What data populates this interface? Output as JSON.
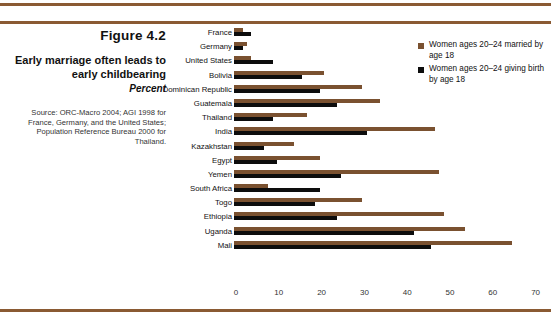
{
  "figure": {
    "number": "Figure 4.2",
    "title": "Early marriage often leads to early childbearing",
    "subtitle": "Percent",
    "source": "Source: ORC-Macro 2004; AGI 1998 for France, Germany, and the United States; Population Reference Bureau 2000 for Thailand."
  },
  "colors": {
    "married_series": "#7a5130",
    "birth_series": "#0d0d0d",
    "rule": "#8a5a33"
  },
  "legend": {
    "items": [
      {
        "label": "Women ages 20–24 married by age 18",
        "color": "#7a5130"
      },
      {
        "label": "Women ages 20–24 giving birth by age 18",
        "color": "#0d0d0d"
      }
    ]
  },
  "axis": {
    "ticks": [
      "0",
      "10",
      "20",
      "30",
      "40",
      "50",
      "60",
      "70"
    ]
  },
  "chart_data": {
    "type": "bar",
    "orientation": "horizontal",
    "title": "Early marriage often leads to early childbearing",
    "xlabel": "Percent",
    "ylabel": "",
    "xlim": [
      0,
      70
    ],
    "grid": false,
    "legend_position": "top-right",
    "categories": [
      "France",
      "Germany",
      "United States",
      "Bolivia",
      "Dominican Republic",
      "Guatemala",
      "Thailand",
      "India",
      "Kazakhstan",
      "Egypt",
      "Yemen",
      "South Africa",
      "Togo",
      "Ethiopia",
      "Uganda",
      "Mali"
    ],
    "series": [
      {
        "name": "Women ages 20–24 married by age 18",
        "color": "#7a5130",
        "values": [
          2,
          3,
          4,
          21,
          30,
          34,
          17,
          47,
          14,
          20,
          48,
          8,
          30,
          49,
          54,
          65
        ]
      },
      {
        "name": "Women ages 20–24 giving birth by age 18",
        "color": "#0d0d0d",
        "values": [
          4,
          2,
          9,
          16,
          20,
          24,
          9,
          31,
          7,
          10,
          25,
          20,
          19,
          24,
          42,
          46
        ]
      }
    ]
  }
}
